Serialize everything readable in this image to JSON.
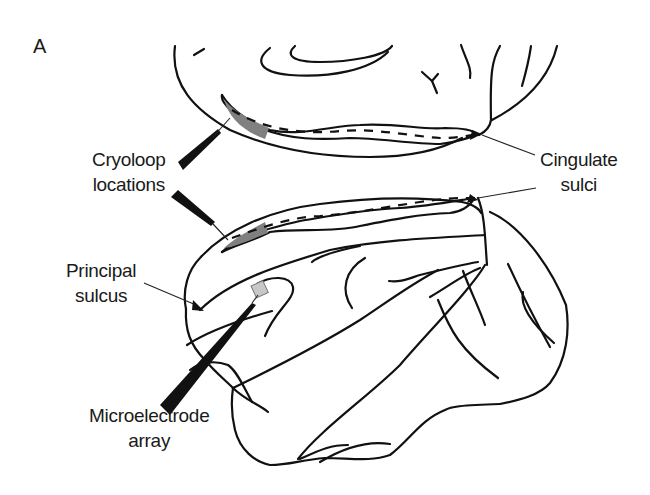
{
  "figure": {
    "panel_label": "A",
    "views": [
      "medial-view-top",
      "lateral-view-bottom"
    ],
    "colors": {
      "outline": "#111111",
      "cryoloop_fill": "#808080",
      "array_fill": "#c8c8c8",
      "background": "#ffffff"
    }
  },
  "labels": {
    "cryoloop": {
      "line1": "Cryoloop",
      "line2": "locations"
    },
    "cingulate": {
      "line1": "Cingulate",
      "line2": "sulci"
    },
    "principal": {
      "line1": "Principal",
      "line2": "sulcus"
    },
    "microelectrode": {
      "line1": "Microelectrode",
      "line2": "array"
    }
  }
}
